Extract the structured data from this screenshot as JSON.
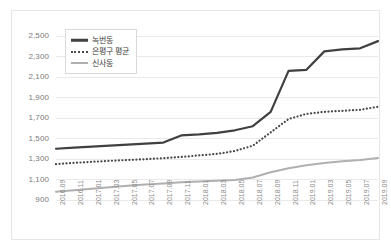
{
  "chart_data": {
    "type": "line",
    "title": "",
    "xlabel": "",
    "ylabel": "",
    "ylim": [
      900,
      2500
    ],
    "ytick_step": 200,
    "grid": true,
    "legend_position": "top-left",
    "ytick_labels": [
      "2,500",
      "2,300",
      "2,100",
      "1,900",
      "1,700",
      "1,500",
      "1,300",
      "1,100",
      "900"
    ],
    "categories": [
      "2016.09",
      "2016.11",
      "2017.01",
      "2017.03",
      "2017.05",
      "2017.07",
      "2017.09",
      "2017.11",
      "2018.01",
      "2018.03",
      "2018.05",
      "2018.07",
      "2018.09",
      "2018.11",
      "2019.01",
      "2019.03",
      "2019.05",
      "2019.07",
      "2019.09"
    ],
    "series": [
      {
        "name": "녹번동",
        "color": "#404040",
        "style": "solid",
        "values": [
          1400,
          1410,
          1420,
          1430,
          1440,
          1450,
          1460,
          1530,
          1540,
          1555,
          1580,
          1620,
          1760,
          2160,
          2170,
          2350,
          2370,
          2380,
          2450
        ]
      },
      {
        "name": "은평구 평균",
        "color": "#4a4a4a",
        "style": "dotted",
        "values": [
          1250,
          1262,
          1272,
          1282,
          1290,
          1298,
          1308,
          1320,
          1335,
          1350,
          1378,
          1430,
          1560,
          1690,
          1740,
          1760,
          1770,
          1780,
          1810
        ]
      },
      {
        "name": "신사동",
        "color": "#b0b0b0",
        "style": "solid",
        "values": [
          980,
          995,
          1010,
          1025,
          1040,
          1052,
          1062,
          1072,
          1080,
          1088,
          1095,
          1120,
          1170,
          1210,
          1240,
          1262,
          1278,
          1290,
          1310
        ]
      }
    ]
  },
  "legend": {
    "items": [
      {
        "label": "녹번동"
      },
      {
        "label": "은평구 평균"
      },
      {
        "label": "신사동"
      }
    ]
  }
}
